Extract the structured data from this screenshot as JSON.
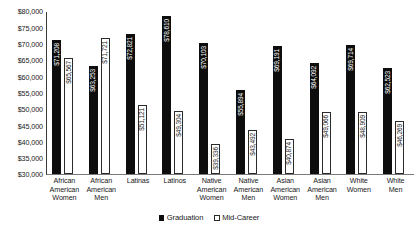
{
  "chart_data": {
    "type": "bar",
    "title": "",
    "subtitle": "",
    "xlabel": "",
    "ylabel": "",
    "ylim": [
      30000,
      80000
    ],
    "ytick_step": 5000,
    "grid": false,
    "legend_position": "bottom-center",
    "value_labels": true,
    "value_label_orientation": "vertical",
    "yticks": [
      "$80,000",
      "$75,000",
      "$70,000",
      "$65,000",
      "$60,000",
      "$55,000",
      "$50,000",
      "$45,000",
      "$40,000",
      "$35,000",
      "$30,000"
    ],
    "ytick_values": [
      80000,
      75000,
      70000,
      65000,
      60000,
      55000,
      50000,
      45000,
      40000,
      35000,
      30000
    ],
    "categories": [
      "African American Women",
      "African American Men",
      "Latinas",
      "Latinos",
      "Native American Women",
      "Native American Men",
      "Asian American Women",
      "Asian American Men",
      "White Women",
      "White Men"
    ],
    "category_lines": [
      [
        "African",
        "American",
        "Women"
      ],
      [
        "African",
        "American",
        "Men"
      ],
      [
        "Latinas"
      ],
      [
        "Latinos"
      ],
      [
        "Native",
        "American",
        "Women"
      ],
      [
        "Native",
        "American",
        "Men"
      ],
      [
        "Asian",
        "American",
        "Women"
      ],
      [
        "Asian",
        "American",
        "Men"
      ],
      [
        "White",
        "Women"
      ],
      [
        "White",
        "Men"
      ]
    ],
    "series": [
      {
        "name": "Graduation",
        "color": "#0d0d0d",
        "values": [
          71208,
          63253,
          72821,
          78610,
          70103,
          55894,
          69191,
          64092,
          69714,
          62523
        ],
        "labels": [
          "$71,208",
          "$63,253",
          "$72,821",
          "$78,610",
          "$70,103",
          "$55,894",
          "$69,191",
          "$64,092",
          "$69,714",
          "$62,523"
        ]
      },
      {
        "name": "Mid-Career",
        "color": "#ffffff",
        "values": [
          65567,
          71721,
          51121,
          49304,
          39336,
          43492,
          40874,
          49066,
          48909,
          46269
        ],
        "labels": [
          "$65,567",
          "$71,721",
          "$51,121",
          "$49,304",
          "$39,336",
          "$43,492",
          "$40,874",
          "$49,066",
          "$48,909",
          "$46,269"
        ]
      }
    ]
  },
  "legend": {
    "items": [
      {
        "label": "Graduation",
        "swatch": "filled-square-black"
      },
      {
        "label": "Mid-Career",
        "swatch": "open-square-white"
      }
    ]
  }
}
